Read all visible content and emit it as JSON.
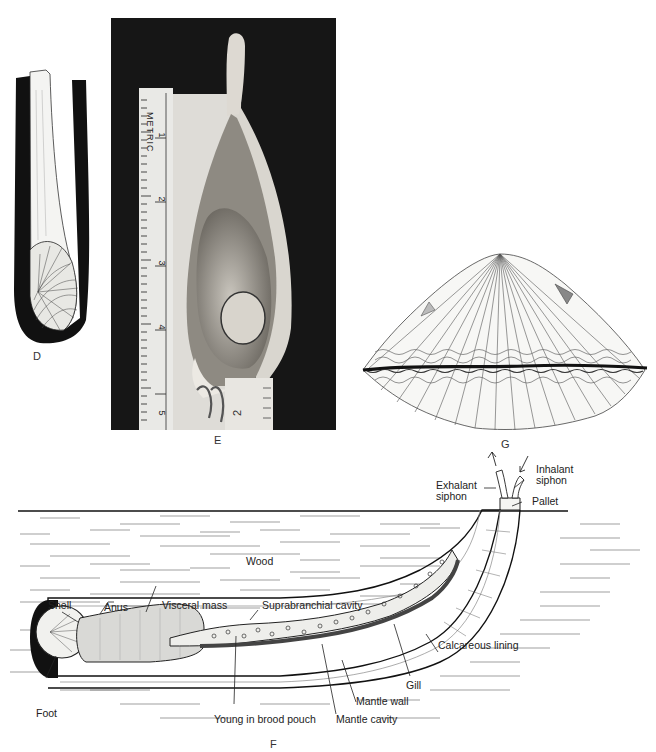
{
  "figure": {
    "panels": [
      {
        "id": "D",
        "label": "D",
        "description": "Shell of shipworm inside dark burrow lining (drawing)"
      },
      {
        "id": "E",
        "label": "E",
        "description": "Photograph of bivalve specimen beside metric ruler"
      },
      {
        "id": "G",
        "label": "G",
        "description": "Drawing of ribbed bivalve shell (cockle) with wavy margin"
      },
      {
        "id": "F",
        "label": "F",
        "description": "Cross-section diagram of shipworm burrow in wood"
      }
    ],
    "ruler": {
      "text": "METRIC",
      "ticks": [
        "1",
        "2",
        "3",
        "4",
        "5"
      ],
      "secondary_tick": "2"
    },
    "diagram_F": {
      "substrate_label": "Wood",
      "labels": {
        "exhalant_siphon": "Exhalant\nsiphon",
        "inhalant_siphon": "Inhalant\nsiphon",
        "pallet": "Pallet",
        "shell": "Shell",
        "anus": "Anus",
        "visceral_mass": "Visceral mass",
        "suprabranchial_cavity": "Suprabranchial cavity",
        "foot": "Foot",
        "young_in_brood_pouch": "Young in brood pouch",
        "mantle_cavity": "Mantle cavity",
        "mantle_wall": "Mantle wall",
        "gill": "Gill",
        "calcareous_lining": "Calcareous lining"
      }
    }
  }
}
